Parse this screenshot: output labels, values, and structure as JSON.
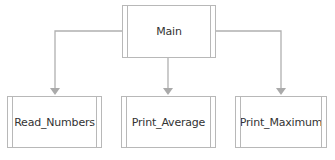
{
  "diagram": {
    "type": "structure-chart",
    "line_color": "#b0b0b0",
    "border_color": "#b8b8b8",
    "root": {
      "label": "Main"
    },
    "children": [
      {
        "label": "Read_Numbers"
      },
      {
        "label": "Print_Average"
      },
      {
        "label": "Print_Maximum"
      }
    ]
  }
}
